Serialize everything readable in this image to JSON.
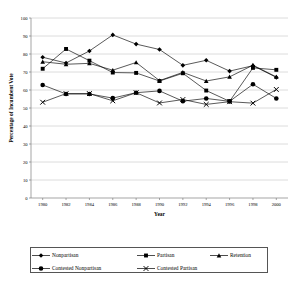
{
  "chart_data": {
    "type": "line",
    "title": "",
    "xlabel": "Year",
    "ylabel": "Percentage of Incumbent Vote",
    "xlim": [
      1979,
      2001
    ],
    "ylim": [
      0,
      100
    ],
    "grid": true,
    "legend_position": "bottom",
    "x": [
      1980,
      1981,
      1982,
      1983,
      1984,
      1985,
      1986,
      1987,
      1988,
      1989,
      1990,
      1991,
      1992,
      1993,
      1994,
      1995,
      1996,
      1997,
      1998,
      1999,
      2000
    ],
    "xticks": [
      "1980",
      "1982",
      "1984",
      "1986",
      "1988",
      "1990",
      "1992",
      "1994",
      "1996",
      "1998",
      "2000"
    ],
    "xtick_values": [
      1980,
      1982,
      1984,
      1986,
      1988,
      1990,
      1992,
      1994,
      1996,
      1998,
      2000
    ],
    "yticks": [
      "0",
      "10",
      "20",
      "30",
      "40",
      "50",
      "60",
      "70",
      "80",
      "90",
      "100"
    ],
    "ytick_values": [
      0,
      10,
      20,
      30,
      40,
      50,
      60,
      70,
      80,
      90,
      100
    ],
    "series": [
      {
        "name": "Nonpartisan",
        "marker": "diamond",
        "x": [
          1980,
          1982,
          1984,
          1986,
          1988,
          1990,
          1992,
          1994,
          1996,
          1998,
          2000
        ],
        "values": [
          78.2,
          75.0,
          81.7,
          90.6,
          85.5,
          82.5,
          73.7,
          76.5,
          70.5,
          73.5,
          67.0
        ]
      },
      {
        "name": "Partisan",
        "marker": "square",
        "x": [
          1980,
          1982,
          1984,
          1986,
          1988,
          1990,
          1992,
          1994,
          1996,
          1998,
          2000
        ],
        "values": [
          71.8,
          82.8,
          76.3,
          69.7,
          69.5,
          65.0,
          69.3,
          59.7,
          53.7,
          72.3,
          71.2
        ]
      },
      {
        "name": "Retention",
        "marker": "triangle",
        "x": [
          1980,
          1982,
          1984,
          1986,
          1988,
          1990,
          1992,
          1994,
          1996,
          1998,
          2000
        ],
        "values": [
          75.7,
          74.3,
          74.8,
          71.0,
          75.3,
          65.2,
          69.8,
          65.0,
          67.3,
          73.8,
          67.3
        ]
      },
      {
        "name": "Contested Nonpartisan",
        "marker": "circle",
        "x": [
          1980,
          1982,
          1984,
          1986,
          1988,
          1990,
          1992,
          1994,
          1996,
          1998,
          2000
        ],
        "values": [
          62.8,
          57.8,
          57.8,
          55.5,
          58.5,
          59.5,
          53.8,
          55.3,
          53.7,
          63.2,
          55.3
        ]
      },
      {
        "name": "Contested Partisan",
        "marker": "cross",
        "x": [
          1980,
          1982,
          1984,
          1986,
          1988,
          1990,
          1992,
          1994,
          1996,
          1998,
          2000
        ],
        "values": [
          53.2,
          58.0,
          58.0,
          54.0,
          58.5,
          52.8,
          54.7,
          52.0,
          53.5,
          52.7,
          60.3
        ]
      }
    ]
  },
  "legend": {
    "items": [
      {
        "label": "Nonpartisan",
        "marker": "diamond"
      },
      {
        "label": "Partisan",
        "marker": "square"
      },
      {
        "label": "Retention",
        "marker": "triangle"
      },
      {
        "label": "Contested Nonpartisan",
        "marker": "circle"
      },
      {
        "label": "Contested Partisan",
        "marker": "cross"
      }
    ]
  },
  "colors": {
    "series": "#000000",
    "grid": "#bfbfbf",
    "axis": "#808080",
    "background": "#ffffff"
  }
}
